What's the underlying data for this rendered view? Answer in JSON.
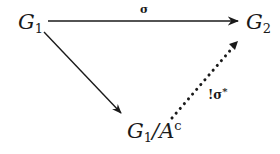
{
  "diagram": {
    "type": "commutative-diagram",
    "nodes": {
      "g1": {
        "base": "G",
        "sub": "1"
      },
      "g2": {
        "base": "G",
        "sub": "2"
      },
      "quotient": {
        "base": "G",
        "sub": "1",
        "slash": "/",
        "denom": "A",
        "sup": "c"
      }
    },
    "arrows": {
      "top": {
        "from": "G1",
        "to": "G2",
        "label": "σ",
        "style": "solid"
      },
      "diagonal": {
        "from": "G1",
        "to": "G1/A^c",
        "label": "",
        "style": "solid"
      },
      "dotted": {
        "from": "G1/A^c",
        "to": "G2",
        "label_bang": "!",
        "label_sigma": "σ",
        "label_star": "*",
        "style": "dotted"
      }
    },
    "colors": {
      "ink": "#1a1a1a",
      "background": "#ffffff"
    }
  }
}
